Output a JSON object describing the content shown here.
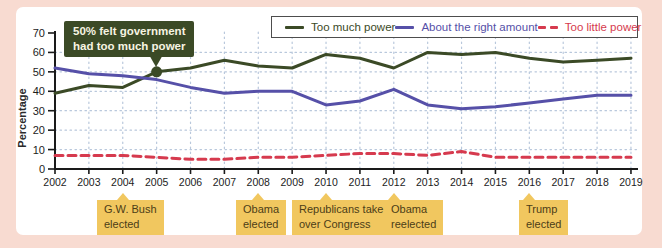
{
  "colors": {
    "frame_pink": "#f8dbd1",
    "panel_white": "#ffffff",
    "axis": "#1a1a1a",
    "gridline": "#b9c8dc",
    "event_box_bg": "#f1c75f",
    "event_box_text": "#4c3d17"
  },
  "chart_data": {
    "type": "line",
    "title": "",
    "xlabel": "",
    "ylabel": "Percentage",
    "ylim": [
      0,
      70
    ],
    "yticks": [
      0,
      10,
      20,
      30,
      40,
      50,
      60,
      70
    ],
    "grid": true,
    "legend_position": "top-right",
    "x": [
      2002,
      2003,
      2004,
      2005,
      2006,
      2007,
      2008,
      2009,
      2010,
      2011,
      2012,
      2013,
      2014,
      2015,
      2016,
      2017,
      2018,
      2019
    ],
    "series": [
      {
        "name": "Too much power",
        "color": "#3b4a26",
        "style": "solid",
        "values": [
          39,
          43,
          42,
          50,
          52,
          56,
          53,
          52,
          59,
          57,
          52,
          60,
          59,
          60,
          57,
          55,
          56,
          57
        ]
      },
      {
        "name": "About the right amount",
        "color": "#5650a8",
        "style": "solid",
        "values": [
          52,
          49,
          48,
          46,
          42,
          39,
          40,
          40,
          33,
          35,
          41,
          33,
          31,
          32,
          34,
          36,
          38,
          38
        ]
      },
      {
        "name": "Too little power",
        "color": "#d63a4e",
        "style": "dashed",
        "values": [
          7,
          7,
          7,
          6,
          5,
          5,
          6,
          6,
          7,
          8,
          8,
          7,
          9,
          6,
          6,
          6,
          6,
          6
        ]
      }
    ]
  },
  "annotation": {
    "line1": "50% felt government",
    "line2": "had too much power",
    "target_year": 2005,
    "target_value": 50,
    "bg": "#3b4a26",
    "text_color": "#f7f4e2"
  },
  "events": [
    {
      "line1": "G.W. Bush",
      "line2": "elected",
      "year": 2004,
      "box_left": 97
    },
    {
      "line1": "Obama",
      "line2": "elected",
      "year": 2008,
      "box_left": 236
    },
    {
      "line1": "Republicans take",
      "line2": "over Congress",
      "year": 2010,
      "box_left": 292
    },
    {
      "line1": "Obama",
      "line2": "reelected",
      "year": 2012,
      "box_left": 384
    },
    {
      "line1": "Trump",
      "line2": "elected",
      "year": 2016,
      "box_left": 519
    }
  ]
}
